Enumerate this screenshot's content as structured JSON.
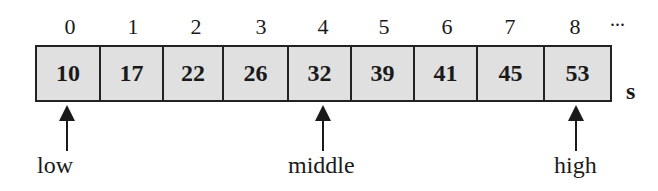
{
  "diagram": {
    "indices": [
      "0",
      "1",
      "2",
      "3",
      "4",
      "5",
      "6",
      "7",
      "8"
    ],
    "ellipsis": "...",
    "values": [
      "10",
      "17",
      "22",
      "26",
      "32",
      "39",
      "41",
      "45",
      "53"
    ],
    "array_name": "s",
    "pointers": [
      {
        "label": "low",
        "index": 0
      },
      {
        "label": "middle",
        "index": 4
      },
      {
        "label": "high",
        "index": 8
      }
    ]
  }
}
